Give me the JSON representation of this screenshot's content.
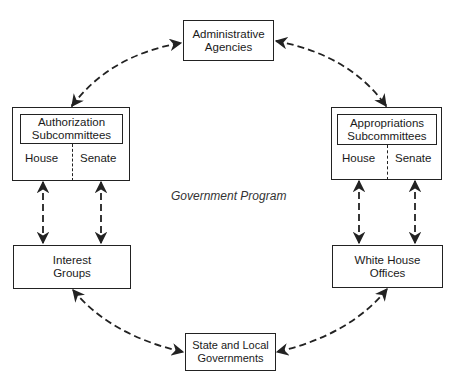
{
  "diagram": {
    "center_label": "Government Program",
    "nodes": {
      "administrative_agencies": {
        "line1": "Administrative",
        "line2": "Agencies"
      },
      "authorization": {
        "line1": "Authorization",
        "line2": "Subcommittees",
        "left": "House",
        "right": "Senate"
      },
      "appropriations": {
        "line1": "Appropriations",
        "line2": "Subcommittees",
        "left": "House",
        "right": "Senate"
      },
      "interest_groups": {
        "line1": "Interest",
        "line2": "Groups"
      },
      "white_house": {
        "line1": "White House",
        "line2": "Offices"
      },
      "state_local": {
        "line1": "State and Local",
        "line2": "Governments"
      }
    },
    "edges": [
      {
        "from": "Authorization Subcommittees",
        "to": "Administrative Agencies",
        "style": "dashed",
        "arrows": "both"
      },
      {
        "from": "Administrative Agencies",
        "to": "Appropriations Subcommittees",
        "style": "dashed",
        "arrows": "both"
      },
      {
        "from": "Authorization Subcommittees (House)",
        "to": "Interest Groups",
        "style": "dashed",
        "arrows": "both"
      },
      {
        "from": "Authorization Subcommittees (Senate)",
        "to": "Interest Groups",
        "style": "dashed",
        "arrows": "both"
      },
      {
        "from": "Appropriations Subcommittees (House)",
        "to": "White House Offices",
        "style": "dashed",
        "arrows": "both"
      },
      {
        "from": "Appropriations Subcommittees (Senate)",
        "to": "White House Offices",
        "style": "dashed",
        "arrows": "both"
      },
      {
        "from": "Interest Groups",
        "to": "State and Local Governments",
        "style": "dashed",
        "arrows": "both"
      },
      {
        "from": "White House Offices",
        "to": "State and Local Governments",
        "style": "dashed",
        "arrows": "both"
      }
    ]
  }
}
